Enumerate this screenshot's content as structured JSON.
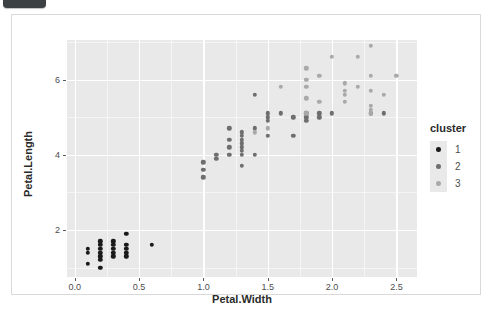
{
  "badge": {
    "name": "top-left-badge"
  },
  "chart_data": {
    "type": "scatter",
    "title": "",
    "xlabel": "Petal.Width",
    "ylabel": "Petal.Length",
    "xlim": [
      -0.06,
      2.66
    ],
    "ylim": [
      0.75,
      7.05
    ],
    "xticks": [
      "0.0",
      "0.5",
      "1.0",
      "1.5",
      "2.0",
      "2.5"
    ],
    "xtickvals": [
      0.0,
      0.5,
      1.0,
      1.5,
      2.0,
      2.5
    ],
    "yticks": [
      "2",
      "4",
      "6"
    ],
    "ytickvals": [
      2,
      4,
      6
    ],
    "grid": true,
    "legend": {
      "title": "cluster",
      "position": "right",
      "entries": [
        {
          "label": "1",
          "color": "#1a1a1a"
        },
        {
          "label": "2",
          "color": "#6e6e6e"
        },
        {
          "label": "3",
          "color": "#a9a9a9"
        }
      ]
    },
    "colors": {
      "cluster1": "#1a1a1a",
      "cluster2": "#6e6e6e",
      "cluster3": "#a9a9a9",
      "panel_bg": "#e9e9e9",
      "grid_color": "#ffffff",
      "card_bg": "#ffffff"
    },
    "series": [
      {
        "name": "1",
        "color": "#1a1a1a",
        "points": [
          [
            0.1,
            1.4
          ],
          [
            0.1,
            1.5
          ],
          [
            0.1,
            1.1
          ],
          [
            0.2,
            1.4
          ],
          [
            0.2,
            1.5
          ],
          [
            0.2,
            1.6
          ],
          [
            0.2,
            1.3
          ],
          [
            0.2,
            1.2
          ],
          [
            0.2,
            1.0
          ],
          [
            0.2,
            1.7
          ],
          [
            0.3,
            1.4
          ],
          [
            0.3,
            1.5
          ],
          [
            0.3,
            1.6
          ],
          [
            0.3,
            1.3
          ],
          [
            0.3,
            1.7
          ],
          [
            0.4,
            1.5
          ],
          [
            0.4,
            1.6
          ],
          [
            0.4,
            1.3
          ],
          [
            0.4,
            1.9
          ],
          [
            0.4,
            1.4
          ],
          [
            0.6,
            1.6
          ]
        ]
      },
      {
        "name": "2",
        "color": "#6e6e6e",
        "points": [
          [
            1.0,
            3.8
          ],
          [
            1.0,
            3.6
          ],
          [
            1.0,
            3.4
          ],
          [
            1.1,
            3.9
          ],
          [
            1.1,
            4.0
          ],
          [
            1.2,
            4.7
          ],
          [
            1.2,
            4.4
          ],
          [
            1.2,
            4.2
          ],
          [
            1.2,
            4.0
          ],
          [
            1.3,
            4.6
          ],
          [
            1.3,
            4.5
          ],
          [
            1.3,
            4.4
          ],
          [
            1.3,
            4.3
          ],
          [
            1.3,
            4.2
          ],
          [
            1.3,
            4.1
          ],
          [
            1.3,
            4.0
          ],
          [
            1.3,
            3.7
          ],
          [
            1.4,
            4.7
          ],
          [
            1.4,
            4.0
          ],
          [
            1.4,
            5.6
          ],
          [
            1.5,
            5.1
          ],
          [
            1.5,
            5.0
          ],
          [
            1.5,
            4.9
          ],
          [
            1.5,
            4.5
          ],
          [
            1.6,
            5.1
          ],
          [
            1.7,
            5.0
          ],
          [
            1.7,
            4.5
          ],
          [
            1.8,
            5.1
          ],
          [
            1.8,
            4.9
          ],
          [
            1.8,
            5.0
          ],
          [
            1.9,
            5.1
          ],
          [
            1.9,
            5.0
          ],
          [
            2.0,
            5.1
          ],
          [
            2.3,
            5.1
          ],
          [
            2.4,
            5.1
          ]
        ]
      },
      {
        "name": "3",
        "color": "#a9a9a9",
        "points": [
          [
            1.4,
            4.6
          ],
          [
            1.5,
            4.7
          ],
          [
            1.6,
            5.8
          ],
          [
            1.8,
            6.3
          ],
          [
            1.8,
            6.0
          ],
          [
            1.8,
            5.8
          ],
          [
            1.8,
            5.5
          ],
          [
            1.8,
            5.1
          ],
          [
            1.9,
            6.1
          ],
          [
            1.9,
            5.4
          ],
          [
            2.0,
            6.6
          ],
          [
            2.1,
            5.9
          ],
          [
            2.1,
            5.7
          ],
          [
            2.1,
            5.6
          ],
          [
            2.1,
            5.4
          ],
          [
            2.2,
            6.6
          ],
          [
            2.2,
            5.8
          ],
          [
            2.3,
            6.9
          ],
          [
            2.3,
            6.1
          ],
          [
            2.3,
            5.7
          ],
          [
            2.3,
            5.3
          ],
          [
            2.3,
            5.2
          ],
          [
            2.3,
            5.1
          ],
          [
            2.4,
            5.6
          ],
          [
            2.5,
            6.1
          ]
        ]
      }
    ]
  }
}
